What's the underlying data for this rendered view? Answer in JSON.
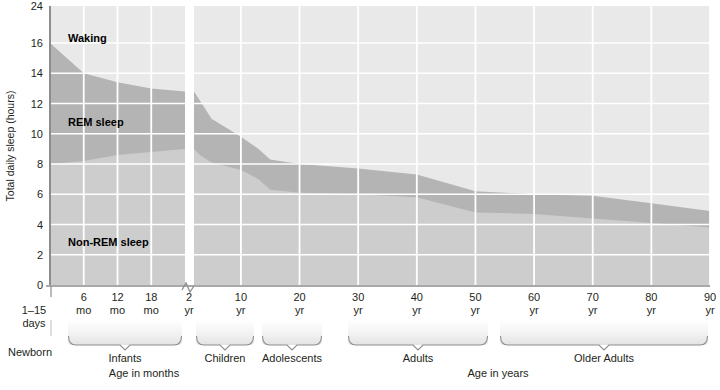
{
  "chart_data": {
    "type": "area",
    "title": "",
    "subtitle": "",
    "ylabel": "Total daily sleep (hours)",
    "xlabel_left": "Age in months",
    "xlabel_right": "Age in years",
    "ylim": [
      0,
      24
    ],
    "yticks": [
      0,
      2,
      4,
      6,
      8,
      10,
      12,
      14,
      16,
      24
    ],
    "ytick_labels": [
      "0",
      "2",
      "4",
      "6",
      "8",
      "10",
      "12",
      "14",
      "16",
      "24"
    ],
    "y_axis_break_between": [
      16,
      24
    ],
    "grid": true,
    "grid_color": "#ffffff",
    "x_axis_break_after": "2 yr",
    "xticks": [
      {
        "label_top": "6",
        "label_bottom": "mo",
        "segment": "months",
        "pos": 0.25
      },
      {
        "label_top": "12",
        "label_bottom": "mo",
        "segment": "months",
        "pos": 0.5
      },
      {
        "label_top": "18",
        "label_bottom": "mo",
        "segment": "months",
        "pos": 0.75
      },
      {
        "label_top": "2",
        "label_bottom": "yr",
        "segment": "months",
        "pos": 1.0
      },
      {
        "label_top": "10",
        "label_bottom": "yr",
        "segment": "years",
        "pos": 10
      },
      {
        "label_top": "20",
        "label_bottom": "yr",
        "segment": "years",
        "pos": 20
      },
      {
        "label_top": "30",
        "label_bottom": "yr",
        "segment": "years",
        "pos": 30
      },
      {
        "label_top": "40",
        "label_bottom": "yr",
        "segment": "years",
        "pos": 40
      },
      {
        "label_top": "50",
        "label_bottom": "yr",
        "segment": "years",
        "pos": 50
      },
      {
        "label_top": "60",
        "label_bottom": "yr",
        "segment": "years",
        "pos": 60
      },
      {
        "label_top": "70",
        "label_bottom": "yr",
        "segment": "years",
        "pos": 70
      },
      {
        "label_top": "80",
        "label_bottom": "yr",
        "segment": "years",
        "pos": 80
      },
      {
        "label_top": "90",
        "label_bottom": "yr",
        "segment": "years",
        "pos": 90
      }
    ],
    "newborn_tick": {
      "label_top": "1–15",
      "label_bottom": "days",
      "group": "Newborn"
    },
    "age_groups": [
      {
        "name": "Newborn",
        "start_px": 50,
        "end_px": 52,
        "bracket": false
      },
      {
        "name": "Infants",
        "start_px": 68,
        "end_px": 182,
        "bracket": true
      },
      {
        "name": "Children",
        "start_px": 196,
        "end_px": 254,
        "bracket": true
      },
      {
        "name": "Adolescents",
        "start_px": 262,
        "end_px": 322,
        "bracket": true
      },
      {
        "name": "Adults",
        "start_px": 348,
        "end_px": 488,
        "bracket": true
      },
      {
        "name": "Older Adults",
        "start_px": 500,
        "end_px": 708,
        "bracket": true
      }
    ],
    "series": [
      {
        "name": "Waking",
        "label": "Waking",
        "color": "#e9e9e9",
        "stack_order": 3,
        "note": "Region above total-sleep curve up to 24 h"
      },
      {
        "name": "REM sleep",
        "label": "REM sleep",
        "color": "#b4b4b4",
        "stack_order": 2,
        "note": "Band between non-REM curve and total-sleep curve"
      },
      {
        "name": "Non-REM sleep",
        "label": "Non-REM sleep",
        "color": "#cdcdcd",
        "stack_order": 1,
        "note": "Band from 0 up to non-REM curve"
      }
    ],
    "total_sleep_hours": [
      {
        "age": "1-15 days",
        "value": 16.0
      },
      {
        "age": "6 mo",
        "value": 14.0
      },
      {
        "age": "12 mo",
        "value": 13.4
      },
      {
        "age": "18 mo",
        "value": 13.0
      },
      {
        "age": "2 yr",
        "value": 12.8
      },
      {
        "age": "3 yr",
        "value": 12.2
      },
      {
        "age": "5 yr",
        "value": 11.0
      },
      {
        "age": "10 yr",
        "value": 9.8
      },
      {
        "age": "13 yr",
        "value": 9.0
      },
      {
        "age": "15 yr",
        "value": 8.3
      },
      {
        "age": "20 yr",
        "value": 8.0
      },
      {
        "age": "30 yr",
        "value": 7.7
      },
      {
        "age": "40 yr",
        "value": 7.3
      },
      {
        "age": "50 yr",
        "value": 6.2
      },
      {
        "age": "60 yr",
        "value": 6.0
      },
      {
        "age": "70 yr",
        "value": 5.9
      },
      {
        "age": "80 yr",
        "value": 5.4
      },
      {
        "age": "90 yr",
        "value": 4.9
      }
    ],
    "non_rem_sleep_hours": [
      {
        "age": "1-15 days",
        "value": 8.0
      },
      {
        "age": "6 mo",
        "value": 8.2
      },
      {
        "age": "12 mo",
        "value": 8.6
      },
      {
        "age": "18 mo",
        "value": 8.8
      },
      {
        "age": "2 yr",
        "value": 9.0
      },
      {
        "age": "3 yr",
        "value": 8.6
      },
      {
        "age": "5 yr",
        "value": 8.1
      },
      {
        "age": "10 yr",
        "value": 7.6
      },
      {
        "age": "13 yr",
        "value": 7.0
      },
      {
        "age": "15 yr",
        "value": 6.3
      },
      {
        "age": "20 yr",
        "value": 6.1
      },
      {
        "age": "30 yr",
        "value": 6.0
      },
      {
        "age": "40 yr",
        "value": 5.8
      },
      {
        "age": "50 yr",
        "value": 4.8
      },
      {
        "age": "60 yr",
        "value": 4.7
      },
      {
        "age": "70 yr",
        "value": 4.4
      },
      {
        "age": "80 yr",
        "value": 4.1
      },
      {
        "age": "90 yr",
        "value": 3.8
      }
    ]
  }
}
